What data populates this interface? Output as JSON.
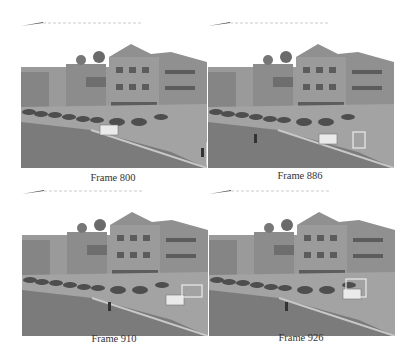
{
  "figure": {
    "panels": [
      {
        "caption": "Frame 800",
        "van_x": 88,
        "person_x": 180,
        "box": {
          "x": 186,
          "y": 121,
          "w": 18,
          "h": 22
        }
      },
      {
        "caption": "Frame 886",
        "van_x": 120,
        "person_x": 46,
        "box": {
          "x": 145,
          "y": 110,
          "w": 12,
          "h": 16
        }
      },
      {
        "caption": "Frame 910",
        "van_x": 153,
        "person_x": 86,
        "box": {
          "x": 160,
          "y": 95,
          "w": 20,
          "h": 12
        }
      },
      {
        "caption": "Frame 926",
        "van_x": 143,
        "person_x": 76,
        "box": {
          "x": 137,
          "y": 89,
          "w": 20,
          "h": 18
        }
      }
    ],
    "colors": {
      "sky": "#ffffff",
      "building": "#8f8f8f",
      "road": "#a8a8a8",
      "grass": "#7a7a7a",
      "box": "#e8e8e8"
    }
  }
}
